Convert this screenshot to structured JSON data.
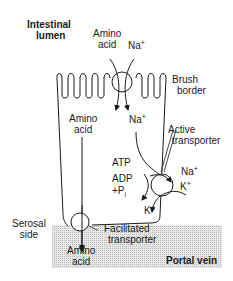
{
  "regions": {
    "lumen": {
      "line1": "Intestinal",
      "line2": "lumen"
    },
    "serosal": {
      "line1": "Serosal",
      "line2": "side"
    },
    "portal_vein": "Portal vein",
    "brush_border": {
      "line1": "Brush",
      "line2": "border"
    }
  },
  "labels": {
    "amino_acid_lumen": {
      "line1": "Amino",
      "line2": "acid"
    },
    "na_lumen": "Na",
    "amino_acid_cell": {
      "line1": "Amino",
      "line2": "acid"
    },
    "na_cell": "Na",
    "active_transporter": {
      "line1": "Active",
      "line2": "transporter"
    },
    "atp": "ATP",
    "adp": "ADP",
    "pi": "+P",
    "pi_sub": "i",
    "na_out": "Na",
    "k_in": "K",
    "k_cell": "K",
    "facilitated_transporter": {
      "line1": "Facilitated",
      "line2": "transporter"
    },
    "amino_acid_blood": {
      "line1": "Amino",
      "line2": "acid"
    },
    "plus": "+"
  },
  "colors": {
    "line": "#1a1a1a",
    "shade": "#d9d9d9"
  }
}
